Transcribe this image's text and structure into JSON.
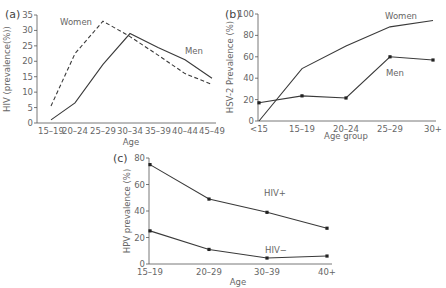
{
  "chart_data": [
    {
      "panel": "(a)",
      "type": "line",
      "title": "",
      "xlabel": "Age",
      "ylabel": "HIV (prevalence(%))",
      "ylim": [
        0,
        35
      ],
      "yticks": [
        0,
        5,
        10,
        15,
        20,
        25,
        30,
        35
      ],
      "categories": [
        "15–19",
        "20–24",
        "25–29",
        "30–34",
        "35–39",
        "40–44",
        "45–49"
      ],
      "series": [
        {
          "name": "Women",
          "style": "dashed",
          "markers": false,
          "values": [
            5.5,
            22.5,
            33,
            28,
            22,
            16,
            12.5
          ]
        },
        {
          "name": "Men",
          "style": "solid",
          "markers": false,
          "values": [
            1,
            6.5,
            19,
            29,
            24.5,
            20.5,
            14.5
          ]
        }
      ],
      "grid": false,
      "legend": "inline labels"
    },
    {
      "panel": "(b)",
      "type": "line",
      "title": "",
      "xlabel": "Age group",
      "ylabel": "HSV-2 Prevalence (%)",
      "ylim": [
        0,
        100
      ],
      "yticks": [
        0,
        20,
        40,
        60,
        80,
        100
      ],
      "categories": [
        "<15",
        "15–19",
        "20–24",
        "25–29",
        "30+"
      ],
      "series": [
        {
          "name": "Women",
          "style": "solid",
          "markers": false,
          "values": [
            0,
            49,
            70,
            88,
            94
          ]
        },
        {
          "name": "Men",
          "style": "solid",
          "markers": true,
          "values": [
            17,
            23.5,
            21.5,
            60,
            57
          ]
        }
      ],
      "grid": false,
      "legend": "inline labels"
    },
    {
      "panel": "(c)",
      "type": "line",
      "title": "",
      "xlabel": "Age",
      "ylabel": "HPV prevalence (%)",
      "ylim": [
        0,
        80
      ],
      "yticks": [
        0,
        20,
        40,
        60,
        80
      ],
      "categories": [
        "15–19",
        "20–29",
        "30–39",
        "40+"
      ],
      "series": [
        {
          "name": "HIV+",
          "style": "solid",
          "markers": true,
          "values": [
            75,
            49,
            39,
            27
          ]
        },
        {
          "name": "HIV−",
          "style": "solid",
          "markers": true,
          "values": [
            25,
            11,
            4.5,
            6
          ]
        }
      ],
      "grid": false,
      "legend": "inline labels"
    }
  ],
  "layout": [
    {
      "x0": 37,
      "x1": 216,
      "yTop": 15,
      "yBot": 123,
      "xs": [
        51,
        75,
        103,
        130,
        158,
        185,
        212
      ],
      "labelPos": [
        {
          "x": 60,
          "y": 25
        },
        {
          "x": 185,
          "y": 54
        }
      ],
      "panelLabelPos": {
        "x": 5,
        "y": 18
      },
      "xlabelPos": {
        "x": 131,
        "y": 145
      },
      "ylabelPos": {
        "x": 10,
        "y": 69
      }
    },
    {
      "x0": 258,
      "x1": 436,
      "yTop": 14,
      "yBot": 121,
      "xs": [
        259,
        302,
        346,
        390,
        433
      ],
      "labelPos": [
        {
          "x": 385,
          "y": 19
        },
        {
          "x": 386,
          "y": 76
        }
      ],
      "panelLabelPos": {
        "x": 225,
        "y": 18
      },
      "xlabelPos": {
        "x": 346,
        "y": 139
      },
      "ylabelPos": {
        "x": 233,
        "y": 67
      }
    },
    {
      "x0": 149,
      "x1": 332,
      "yTop": 158,
      "yBot": 264,
      "xs": [
        150,
        209,
        267,
        327
      ],
      "labelPos": [
        {
          "x": 264,
          "y": 196
        },
        {
          "x": 265,
          "y": 253
        }
      ],
      "panelLabelPos": {
        "x": 113,
        "y": 162
      },
      "xlabelPos": {
        "x": 238,
        "y": 285
      },
      "ylabelPos": {
        "x": 130,
        "y": 211
      }
    }
  ]
}
